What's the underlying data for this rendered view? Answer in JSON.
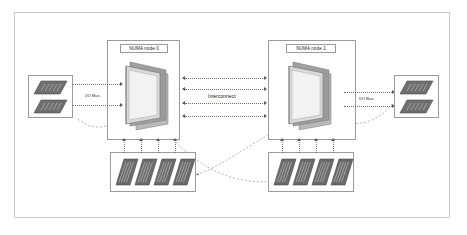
{
  "diagram": {
    "frame": {
      "border_color": "#c9c9c9"
    },
    "nodes": [
      {
        "id": "node0",
        "label": "NUMA node 0"
      },
      {
        "id": "node1",
        "label": "NUMA node 1"
      }
    ],
    "interconnect": {
      "label": "Interconnect",
      "lines": 4,
      "bidirectional": true
    },
    "buses": [
      {
        "id": "io-bus-left",
        "label": "I/O Bus",
        "lines": 2
      },
      {
        "id": "io-bus-right",
        "label": "I/O Bus",
        "lines": 2
      }
    ],
    "memory_groups": [
      {
        "id": "memory-left",
        "modules": 4,
        "channels": 4
      },
      {
        "id": "memory-right",
        "modules": 4,
        "channels": 4
      }
    ],
    "io_groups": [
      {
        "id": "io-devices-left",
        "devices": 2
      },
      {
        "id": "io-devices-right",
        "devices": 2
      }
    ],
    "cpus": [
      {
        "id": "cpu-node0"
      },
      {
        "id": "cpu-node1"
      }
    ],
    "colors": {
      "line": "#6f6f6f",
      "box_border": "#9b9b9b",
      "frame": "#c9c9c9",
      "chip_body": "#8f8f8f",
      "chip_face": "#efefef",
      "module": "#6e6e6e",
      "text": "#1a1a1a"
    }
  }
}
